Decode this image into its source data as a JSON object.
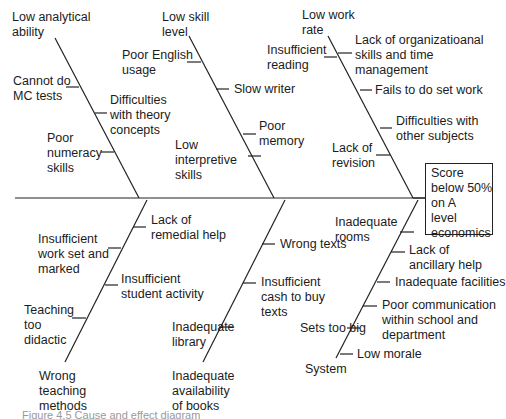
{
  "diagram": {
    "type": "fishbone",
    "effect": "Score\nbelow 50%\non A\nlevel\neconomics",
    "categories": {
      "low_analytical_ability": {
        "label": "Low analytical\nability",
        "causes": [
          "Cannot do\nMC tests",
          "Difficulties\nwith theory\nconcepts",
          "Poor\nnumeracy\nskills"
        ]
      },
      "low_skill_level": {
        "label": "Low skill\nlevel",
        "causes": [
          "Poor English\nusage",
          "Slow writer",
          "Poor\nmemory",
          "Low\ninterpretive\nskills"
        ]
      },
      "low_work_rate": {
        "label": "Low work\nrate",
        "causes": [
          "Insufficient\nreading",
          "Lack of organizatioanal\nskills and time\nmanagement",
          "Fails to do set work",
          "Difficulties with\nother subjects",
          "Lack of\nrevision"
        ]
      },
      "wrong_teaching_methods": {
        "label": "Wrong\nteaching\nmethods",
        "causes": [
          "Lack of\nremedial help",
          "Insufficient\nwork set and\nmarked",
          "Insufficient\nstudent activity",
          "Teaching\ntoo\ndidactic"
        ]
      },
      "inadequate_availability_of_books": {
        "label": "Inadequate\navailability\nof books",
        "causes": [
          "Wrong texts",
          "Insufficient\ncash to buy\ntexts",
          "Inadequate\nlibrary"
        ]
      },
      "system": {
        "label": "System",
        "causes": [
          "Inadequate\nrooms",
          "Lack of\nancillary help",
          "Inadequate facilities",
          "Poor communication\nwithin school and\ndepartment",
          "Sets too big",
          "Low morale"
        ]
      }
    },
    "caption": "Figure 4.5 Cause and effect diagram"
  },
  "colors": {
    "line": "#222222",
    "text": "#1c1c1c",
    "background": "#ffffff"
  }
}
